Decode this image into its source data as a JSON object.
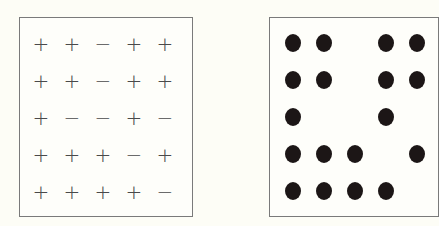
{
  "figure": {
    "left_panel": {
      "description": "5x5 grid of plus/minus signs",
      "rows": [
        [
          "+",
          "+",
          "−",
          "+",
          "+"
        ],
        [
          "+",
          "+",
          "−",
          "+",
          "+"
        ],
        [
          "+",
          "−",
          "−",
          "+",
          "−"
        ],
        [
          "+",
          "+",
          "+",
          "−",
          "+"
        ],
        [
          "+",
          "+",
          "+",
          "+",
          "−"
        ]
      ]
    },
    "right_panel": {
      "description": "5x5 grid where filled dots mark positions of plus signs",
      "rows": [
        [
          1,
          1,
          0,
          1,
          1
        ],
        [
          1,
          1,
          0,
          1,
          1
        ],
        [
          1,
          0,
          0,
          1,
          0
        ],
        [
          1,
          1,
          1,
          0,
          1
        ],
        [
          1,
          1,
          1,
          1,
          0
        ]
      ]
    },
    "colors": {
      "background": "#fdfdf6",
      "border": "#7a7a7a",
      "symbol": "#4a4a4a",
      "dot": "#1c1616"
    }
  }
}
